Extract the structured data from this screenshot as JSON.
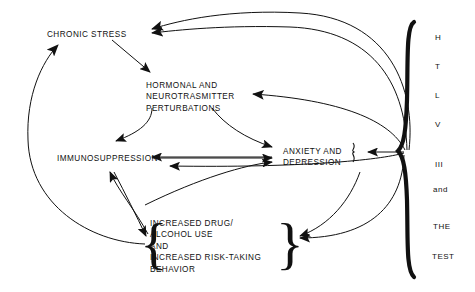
{
  "diagram": {
    "background_color": "#ffffff",
    "ink_color": "#111111",
    "nodes": [
      {
        "id": "chronic-stress",
        "label": "CHRONIC STRESS",
        "x": 47,
        "y": 29
      },
      {
        "id": "hormonal",
        "label": "HORMONAL AND\nNEUROTRASMITTER\nPERTURBATIONS",
        "x": 146,
        "y": 80
      },
      {
        "id": "immunosuppression",
        "label": "IMMUNOSUPPRESSION",
        "x": 57,
        "y": 153
      },
      {
        "id": "anxiety",
        "label": "ANXIETY AND\nDEPRESSION",
        "x": 283,
        "y": 146
      },
      {
        "id": "behavior",
        "label": "INCREASED DRUG/\nALCOHOL USE\nAND\nINCREASED RISK-TAKING\nBEHAVIOR",
        "x": 150,
        "y": 218
      }
    ],
    "braces": {
      "behavior_left": "{",
      "behavior_right": "}",
      "anxiety_right": "}",
      "htlv_main": "}"
    },
    "htlv_column": {
      "items": [
        "H",
        "T",
        "L",
        "V",
        "III",
        "and",
        "THE",
        "TEST"
      ],
      "x": 435,
      "start_y": 33,
      "step_y": 29
    },
    "edges": [
      {
        "from": "htlv",
        "to": "chronic-stress",
        "style": "curved"
      },
      {
        "from": "htlv",
        "to": "chronic-stress",
        "style": "curved-2"
      },
      {
        "from": "chronic-stress",
        "to": "hormonal",
        "style": "straight"
      },
      {
        "from": "hormonal",
        "to": "immunosuppression",
        "style": "curved"
      },
      {
        "from": "hormonal",
        "to": "anxiety",
        "style": "curved"
      },
      {
        "from": "htlv",
        "to": "hormonal",
        "style": "curved"
      },
      {
        "from": "immunosuppression",
        "to": "anxiety",
        "style": "double-headed"
      },
      {
        "from": "htlv",
        "to": "immunosuppression",
        "style": "curved"
      },
      {
        "from": "htlv",
        "to": "anxiety",
        "style": "short"
      },
      {
        "from": "behavior",
        "to": "anxiety",
        "style": "curved"
      },
      {
        "from": "behavior",
        "to": "immunosuppression",
        "style": "double-headed-vertical"
      },
      {
        "from": "behavior",
        "to": "chronic-stress",
        "style": "long-curve"
      },
      {
        "from": "anxiety",
        "to": "behavior",
        "style": "curved"
      },
      {
        "from": "htlv",
        "to": "behavior",
        "style": "curved"
      }
    ]
  }
}
